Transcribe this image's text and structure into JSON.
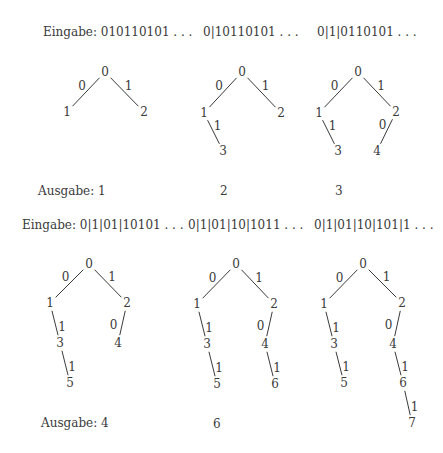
{
  "rows": [
    {
      "inputs": [
        {
          "text": "Eingabe: 010110101 . . .",
          "x": 43,
          "y": 25
        },
        {
          "text": "0|10110101 . . .",
          "x": 203,
          "y": 25
        },
        {
          "text": "0|1|0110101 . . .",
          "x": 317,
          "y": 25
        }
      ],
      "outputs": [
        {
          "text": "Ausgabe: 1",
          "x": 38,
          "y": 184
        },
        {
          "text": "2",
          "x": 220,
          "y": 184
        },
        {
          "text": "3",
          "x": 335,
          "y": 184
        }
      ]
    },
    {
      "inputs": [
        {
          "text": "Eingabe: 0|1|01|10101 . . .",
          "x": 22,
          "y": 218
        },
        {
          "text": "0|1|01|10|1011 . . .",
          "x": 188,
          "y": 218
        },
        {
          "text": "0|1|01|10|101|1 . . .",
          "x": 314,
          "y": 218
        }
      ],
      "outputs": [
        {
          "text": "Ausgabe: 4",
          "x": 41,
          "y": 416
        },
        {
          "text": "6",
          "x": 213,
          "y": 417
        }
      ]
    }
  ],
  "trees": [
    {
      "nodes": [
        {
          "label": "0",
          "x": 105,
          "y": 72
        },
        {
          "label": "1",
          "x": 67,
          "y": 112
        },
        {
          "label": "2",
          "x": 144,
          "y": 112
        }
      ],
      "edges": [
        {
          "from": 0,
          "to": 1,
          "label": "0"
        },
        {
          "from": 0,
          "to": 2,
          "label": "1"
        }
      ]
    },
    {
      "nodes": [
        {
          "label": "0",
          "x": 242,
          "y": 72
        },
        {
          "label": "1",
          "x": 204,
          "y": 113
        },
        {
          "label": "2",
          "x": 281,
          "y": 113
        },
        {
          "label": "3",
          "x": 223,
          "y": 151
        }
      ],
      "edges": [
        {
          "from": 0,
          "to": 1,
          "label": "0"
        },
        {
          "from": 0,
          "to": 2,
          "label": "1"
        },
        {
          "from": 1,
          "to": 3,
          "label": "1"
        }
      ]
    },
    {
      "nodes": [
        {
          "label": "0",
          "x": 358,
          "y": 72
        },
        {
          "label": "1",
          "x": 319,
          "y": 113
        },
        {
          "label": "2",
          "x": 396,
          "y": 112
        },
        {
          "label": "3",
          "x": 338,
          "y": 151
        },
        {
          "label": "4",
          "x": 377,
          "y": 151
        }
      ],
      "edges": [
        {
          "from": 0,
          "to": 1,
          "label": "0"
        },
        {
          "from": 0,
          "to": 2,
          "label": "1"
        },
        {
          "from": 1,
          "to": 3,
          "label": "1"
        },
        {
          "from": 2,
          "to": 4,
          "label": "0"
        }
      ]
    },
    {
      "nodes": [
        {
          "label": "0",
          "x": 89,
          "y": 264
        },
        {
          "label": "1",
          "x": 50,
          "y": 303
        },
        {
          "label": "2",
          "x": 127,
          "y": 303
        },
        {
          "label": "3",
          "x": 60,
          "y": 343
        },
        {
          "label": "4",
          "x": 118,
          "y": 343
        },
        {
          "label": "5",
          "x": 70,
          "y": 383
        }
      ],
      "edges": [
        {
          "from": 0,
          "to": 1,
          "label": "0"
        },
        {
          "from": 0,
          "to": 2,
          "label": "1"
        },
        {
          "from": 1,
          "to": 3,
          "label": "1"
        },
        {
          "from": 2,
          "to": 4,
          "label": "0"
        },
        {
          "from": 3,
          "to": 5,
          "label": "1"
        }
      ]
    },
    {
      "nodes": [
        {
          "label": "0",
          "x": 236,
          "y": 264
        },
        {
          "label": "1",
          "x": 197,
          "y": 304
        },
        {
          "label": "2",
          "x": 274,
          "y": 304
        },
        {
          "label": "3",
          "x": 207,
          "y": 344
        },
        {
          "label": "4",
          "x": 265,
          "y": 344
        },
        {
          "label": "5",
          "x": 217,
          "y": 384
        },
        {
          "label": "6",
          "x": 275,
          "y": 384
        }
      ],
      "edges": [
        {
          "from": 0,
          "to": 1,
          "label": "0"
        },
        {
          "from": 0,
          "to": 2,
          "label": "1"
        },
        {
          "from": 1,
          "to": 3,
          "label": "1"
        },
        {
          "from": 2,
          "to": 4,
          "label": "0"
        },
        {
          "from": 3,
          "to": 5,
          "label": "1"
        },
        {
          "from": 4,
          "to": 6,
          "label": "1"
        }
      ]
    },
    {
      "nodes": [
        {
          "label": "0",
          "x": 363,
          "y": 264
        },
        {
          "label": "1",
          "x": 324,
          "y": 304
        },
        {
          "label": "2",
          "x": 402,
          "y": 303
        },
        {
          "label": "3",
          "x": 334,
          "y": 344
        },
        {
          "label": "4",
          "x": 393,
          "y": 344
        },
        {
          "label": "5",
          "x": 344,
          "y": 383
        },
        {
          "label": "6",
          "x": 403,
          "y": 383
        },
        {
          "label": "7",
          "x": 412,
          "y": 423
        }
      ],
      "edges": [
        {
          "from": 0,
          "to": 1,
          "label": "0"
        },
        {
          "from": 0,
          "to": 2,
          "label": "1"
        },
        {
          "from": 1,
          "to": 3,
          "label": "1"
        },
        {
          "from": 2,
          "to": 4,
          "label": "0"
        },
        {
          "from": 3,
          "to": 5,
          "label": "1"
        },
        {
          "from": 4,
          "to": 6,
          "label": "1"
        },
        {
          "from": 6,
          "to": 7,
          "label": "1"
        }
      ]
    }
  ]
}
